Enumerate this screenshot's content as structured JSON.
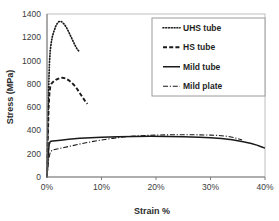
{
  "chart_data": {
    "type": "line",
    "title": "",
    "xlabel": "Strain %",
    "ylabel": "Stress (MPa)",
    "xlim": [
      0,
      40
    ],
    "ylim": [
      0,
      1400
    ],
    "xticks": [
      "0%",
      "10%",
      "20%",
      "30%",
      "40%"
    ],
    "xtick_values": [
      0,
      10,
      20,
      30,
      40
    ],
    "yticks": [
      "0",
      "200",
      "400",
      "600",
      "800",
      "1000",
      "1200",
      "1400"
    ],
    "ytick_values": [
      0,
      200,
      400,
      600,
      800,
      1000,
      1200,
      1400
    ],
    "grid": false,
    "legend_position": "top-right",
    "series": [
      {
        "name": "UHS tube",
        "style": "dotted",
        "color": "#1a1a1a",
        "points": [
          [
            0.0,
            0
          ],
          [
            0.15,
            420
          ],
          [
            0.3,
            760
          ],
          [
            0.45,
            980
          ],
          [
            0.6,
            1090
          ],
          [
            0.8,
            1160
          ],
          [
            1.0,
            1210
          ],
          [
            1.3,
            1255
          ],
          [
            1.6,
            1295
          ],
          [
            1.9,
            1320
          ],
          [
            2.2,
            1335
          ],
          [
            2.5,
            1338
          ],
          [
            2.8,
            1330
          ],
          [
            3.1,
            1315
          ],
          [
            3.5,
            1290
          ],
          [
            3.9,
            1255
          ],
          [
            4.3,
            1215
          ],
          [
            4.7,
            1175
          ],
          [
            5.1,
            1135
          ],
          [
            5.5,
            1100
          ],
          [
            5.9,
            1078
          ]
        ]
      },
      {
        "name": "HS tube",
        "style": "dashed",
        "color": "#1a1a1a",
        "points": [
          [
            0.0,
            0
          ],
          [
            0.15,
            340
          ],
          [
            0.3,
            600
          ],
          [
            0.45,
            720
          ],
          [
            0.6,
            775
          ],
          [
            0.8,
            800
          ],
          [
            1.0,
            812
          ],
          [
            1.3,
            824
          ],
          [
            1.6,
            834
          ],
          [
            2.0,
            843
          ],
          [
            2.4,
            850
          ],
          [
            2.8,
            852
          ],
          [
            3.2,
            849
          ],
          [
            3.6,
            841
          ],
          [
            4.0,
            830
          ],
          [
            4.5,
            812
          ],
          [
            5.0,
            788
          ],
          [
            5.5,
            758
          ],
          [
            6.0,
            722
          ],
          [
            6.5,
            686
          ],
          [
            7.0,
            652
          ],
          [
            7.4,
            628
          ]
        ]
      },
      {
        "name": "Mild tube",
        "style": "solid",
        "color": "#1a1a1a",
        "points": [
          [
            0.0,
            0
          ],
          [
            0.2,
            180
          ],
          [
            0.4,
            280
          ],
          [
            0.6,
            305
          ],
          [
            1.0,
            310
          ],
          [
            1.6,
            312
          ],
          [
            2.5,
            316
          ],
          [
            4.0,
            324
          ],
          [
            6.0,
            332
          ],
          [
            8.0,
            338
          ],
          [
            10.0,
            342
          ],
          [
            13.0,
            346
          ],
          [
            16.0,
            348
          ],
          [
            19.0,
            349
          ],
          [
            22.0,
            348
          ],
          [
            25.0,
            346
          ],
          [
            28.0,
            342
          ],
          [
            30.0,
            338
          ],
          [
            32.0,
            331
          ],
          [
            34.0,
            320
          ],
          [
            36.0,
            303
          ],
          [
            37.5,
            288
          ],
          [
            38.5,
            274
          ],
          [
            39.3,
            260
          ],
          [
            40.0,
            248
          ]
        ]
      },
      {
        "name": "Mild plate",
        "style": "dashdot",
        "color": "#1a1a1a",
        "points": [
          [
            0.0,
            0
          ],
          [
            0.3,
            150
          ],
          [
            0.6,
            215
          ],
          [
            1.0,
            232
          ],
          [
            1.6,
            238
          ],
          [
            2.5,
            247
          ],
          [
            4.0,
            262
          ],
          [
            6.0,
            283
          ],
          [
            8.0,
            302
          ],
          [
            10.0,
            318
          ],
          [
            12.0,
            332
          ],
          [
            14.0,
            344
          ],
          [
            16.0,
            352
          ],
          [
            18.0,
            357
          ],
          [
            20.0,
            360
          ],
          [
            22.0,
            362
          ],
          [
            24.0,
            363
          ],
          [
            26.0,
            363
          ],
          [
            28.0,
            362
          ],
          [
            30.0,
            360
          ],
          [
            31.5,
            357
          ],
          [
            33.0,
            350
          ],
          [
            34.0,
            342
          ],
          [
            35.0,
            330
          ],
          [
            35.8,
            318
          ]
        ]
      }
    ]
  },
  "legend": {
    "items": [
      {
        "label": "UHS tube",
        "style": "dotted"
      },
      {
        "label": "HS tube",
        "style": "dashed"
      },
      {
        "label": "Mild tube",
        "style": "solid"
      },
      {
        "label": "Mild plate",
        "style": "dashdot"
      }
    ]
  },
  "colors": {
    "line": "#1a1a1a",
    "axis": "#7f7f7f",
    "frame": "#bfbfbf",
    "text": "#2b2b2b",
    "background": "#ffffff"
  }
}
